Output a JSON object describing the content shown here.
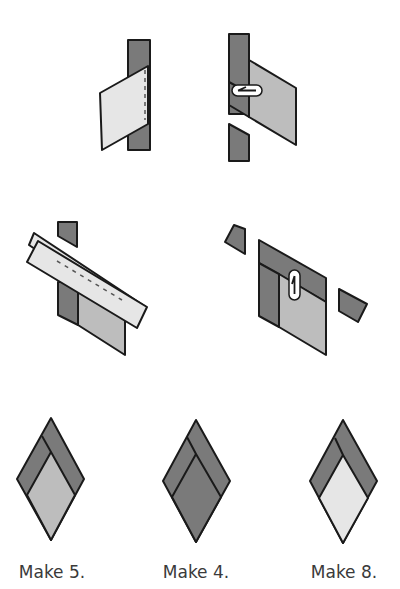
{
  "colors": {
    "dark": "#7a7a7a",
    "medium": "#bdbdbd",
    "light": "#e6e6e6",
    "stroke": "#1a1a1a",
    "background": "#ffffff"
  },
  "steps": [
    {
      "id": "step1",
      "description": "Light parallelogram placed on dark strip with dashed seam line"
    },
    {
      "id": "step2",
      "description": "Pressed medium parallelogram with dark strip, press arrow, trimmed dark piece below"
    },
    {
      "id": "step3",
      "description": "Light strip laid diagonally across unit with dashed seam, dark triangle above"
    },
    {
      "id": "step4",
      "description": "Pressed unit with dark band, press arrow, and two dark trimmed pieces"
    }
  ],
  "results": [
    {
      "id": "unit-a",
      "fill_inner": "medium",
      "caption": "Make 5."
    },
    {
      "id": "unit-b",
      "fill_inner": "dark",
      "caption": "Make 4."
    },
    {
      "id": "unit-c",
      "fill_inner": "light",
      "caption": "Make 8."
    }
  ]
}
